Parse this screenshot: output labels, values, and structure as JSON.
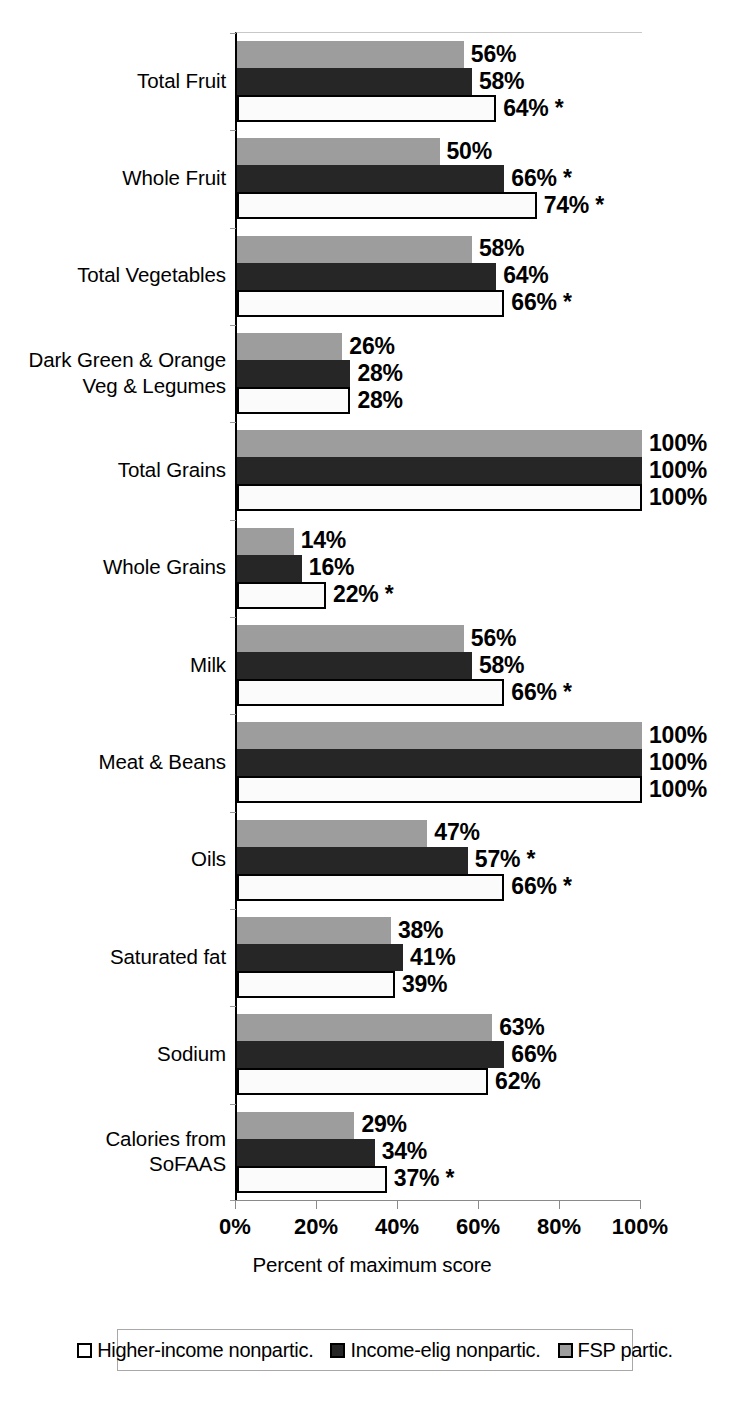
{
  "chart_data": {
    "type": "bar",
    "orientation": "horizontal",
    "title": "",
    "xlabel": "Percent of maximum score",
    "ylabel": "",
    "xlim": [
      0,
      100
    ],
    "xticks": [
      "0%",
      "20%",
      "40%",
      "60%",
      "80%",
      "100%"
    ],
    "xtick_values": [
      0,
      20,
      40,
      60,
      80,
      100
    ],
    "grid": false,
    "legend_position": "bottom",
    "categories": [
      "Total Fruit",
      "Whole Fruit",
      "Total Vegetables",
      "Dark Green & Orange Veg & Legumes",
      "Total Grains",
      "Whole Grains",
      "Milk",
      "Meat & Beans",
      "Oils",
      "Saturated fat",
      "Sodium",
      "Calories from SoFAAS"
    ],
    "category_lines": [
      [
        "Total Fruit"
      ],
      [
        "Whole Fruit"
      ],
      [
        "Total Vegetables"
      ],
      [
        "Dark Green & Orange",
        "Veg & Legumes"
      ],
      [
        "Total Grains"
      ],
      [
        "Whole Grains"
      ],
      [
        "Milk"
      ],
      [
        "Meat & Beans"
      ],
      [
        "Oils"
      ],
      [
        "Saturated fat"
      ],
      [
        "Sodium"
      ],
      [
        "Calories from",
        "SoFAAS"
      ]
    ],
    "series": [
      {
        "name": "FSP partic.",
        "style": "gray",
        "color": "#9d9d9d",
        "values": [
          56,
          50,
          58,
          26,
          100,
          14,
          56,
          100,
          47,
          38,
          63,
          29
        ],
        "labels": [
          "56%",
          "50%",
          "58%",
          "26%",
          "100%",
          "14%",
          "56%",
          "100%",
          "47%",
          "38%",
          "63%",
          "29%"
        ]
      },
      {
        "name": "Income-elig nonpartic.",
        "style": "black",
        "color": "#262626",
        "values": [
          58,
          66,
          64,
          28,
          100,
          16,
          58,
          100,
          57,
          41,
          66,
          34
        ],
        "labels": [
          "58%",
          "66% *",
          "64%",
          "28%",
          "100%",
          "16%",
          "58%",
          "100%",
          "57% *",
          "41%",
          "66%",
          "34%"
        ]
      },
      {
        "name": "Higher-income nonpartic.",
        "style": "white",
        "color": "#ffffff",
        "values": [
          64,
          74,
          66,
          28,
          100,
          22,
          66,
          100,
          66,
          39,
          62,
          37
        ],
        "labels": [
          "64% *",
          "74% *",
          "66% *",
          "28%",
          "100%",
          "22% *",
          "66% *",
          "100%",
          "66% *",
          "39%",
          "62%",
          "37% *"
        ]
      }
    ],
    "series_draw_order": [
      "gray",
      "black",
      "white"
    ],
    "annotation_note": "* denotes statistically significant difference"
  },
  "legend": {
    "items": [
      {
        "label": "Higher-income nonpartic.",
        "style": "white"
      },
      {
        "label": "Income-elig nonpartic.",
        "style": "black"
      },
      {
        "label": "FSP partic.",
        "style": "gray"
      }
    ]
  },
  "axis": {
    "title": "Percent of maximum score",
    "ticks": [
      "0%",
      "20%",
      "40%",
      "60%",
      "80%",
      "100%"
    ]
  },
  "colors": {
    "gray_series": "#9d9d9d",
    "black_series": "#262626",
    "white_series": "#ffffff",
    "axis": "#8a8a8a",
    "text": "#000000"
  }
}
